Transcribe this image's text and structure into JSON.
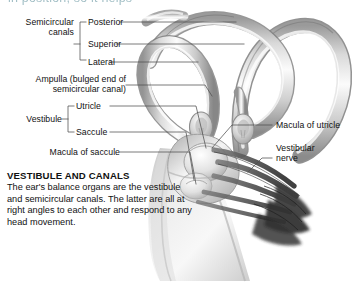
{
  "page": {
    "background": "#ffffff",
    "cut_off_heading": "in position, so it helps"
  },
  "labels": {
    "group_semicircular": "Semicircular\ncanals",
    "semicircular_line1": "Semicircular",
    "semicircular_line2": "canals",
    "posterior": "Posterior",
    "superior": "Superior",
    "lateral": "Lateral",
    "ampulla_line1": "Ampulla (bulged end of",
    "ampulla_line2": "semicircular canal)",
    "vestibule": "Vestibule",
    "utricle": "Utricle",
    "saccule": "Saccule",
    "macula_of_saccule": "Macula of saccule",
    "macula_of_utricle": "Macula of utricle",
    "vestibular_nerve_line1": "Vestibular",
    "vestibular_nerve_line2": "nerve"
  },
  "caption": {
    "title": "VESTIBULE AND CANALS",
    "body": "The ear's balance organs are the vestibule and semicircular canals. The latter are all at right angles to each other and respond to any head movement."
  },
  "illustration": {
    "name": "inner-ear-vestibular-apparatus",
    "description": "Grey-shaded anatomical rendering of the bony labyrinth: three semicircular canals with ampullae, the vestibule containing utricle and saccule, the cochlea, and the vestibular nerve fibre bundle.",
    "colors": {
      "tube_light": "#f2f2f2",
      "tube_mid": "#c6c6c6",
      "tube_dark": "#8e8e8e",
      "tube_shadow": "#6e6e6e",
      "cochlea_fill": "#e3e3e3",
      "nerve_dark": "#3a3a3a",
      "leader_line": "#555555",
      "text": "#111111"
    },
    "parts": [
      "posterior semicircular canal",
      "superior semicircular canal",
      "lateral semicircular canal",
      "ampulla",
      "utricle",
      "saccule",
      "macula of utricle",
      "macula of saccule",
      "vestibular nerve",
      "cochlea"
    ]
  }
}
